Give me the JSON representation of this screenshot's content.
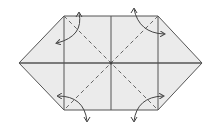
{
  "diagram": {
    "type": "origami-fold-diagram",
    "colors": {
      "paper_fill": "#ebebeb",
      "line": "#555555",
      "dashed": "#666666",
      "arrow": "#444444",
      "background": "#ffffff"
    },
    "outline": [
      [
        19,
        63
      ],
      [
        64,
        16
      ],
      [
        158,
        16
      ],
      [
        202,
        63
      ],
      [
        158,
        110
      ],
      [
        64,
        110
      ]
    ],
    "creases": {
      "vertical": [
        64,
        111,
        158
      ],
      "horizontal_y": 63
    },
    "valley_folds": [
      [
        [
          64,
          16
        ],
        [
          158,
          110
        ]
      ],
      [
        [
          158,
          16
        ],
        [
          64,
          110
        ]
      ]
    ],
    "arrows": [
      {
        "name": "top-left",
        "path": "M 79 13 Q 84 36 57 43",
        "head": [
          57,
          43
        ]
      },
      {
        "name": "top-right",
        "path": "M 134 9 Q 139 33 164 34",
        "head": [
          164,
          34
        ]
      },
      {
        "name": "bottom-left",
        "path": "M 58 96 Q 84 96 87 121",
        "head": [
          87,
          121
        ]
      },
      {
        "name": "bottom-right",
        "path": "M 163 96 Q 137 97 134 121",
        "head": [
          134,
          121
        ]
      }
    ]
  }
}
